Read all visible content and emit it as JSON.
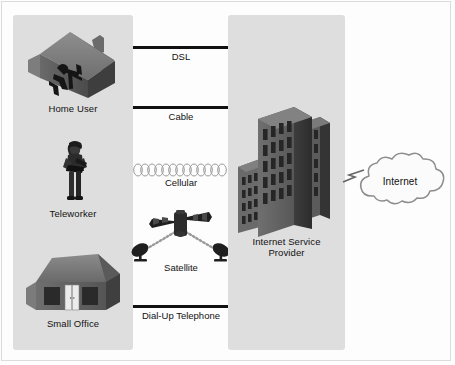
{
  "diagram": {
    "background_color": "#fdfdfd",
    "panel_color": "#dedede",
    "line_color": "#111111"
  },
  "left_panel": {
    "name": "customer-premises",
    "items": [
      {
        "id": "home-user",
        "label": "Home User",
        "icon": "house-with-user-icon"
      },
      {
        "id": "teleworker",
        "label": "Teleworker",
        "icon": "person-with-laptop-icon"
      },
      {
        "id": "small-office",
        "label": "Small Office",
        "icon": "small-office-building-icon"
      }
    ]
  },
  "connections": {
    "name": "access-technologies",
    "items": [
      {
        "id": "dsl",
        "label": "DSL",
        "style": "solid-line"
      },
      {
        "id": "cable",
        "label": "Cable",
        "style": "solid-line"
      },
      {
        "id": "cellular",
        "label": "Cellular",
        "style": "wave-loops"
      },
      {
        "id": "satellite",
        "label": "Satellite",
        "style": "satellite-dishes"
      },
      {
        "id": "dialup",
        "label": "Dial-Up Telephone",
        "style": "solid-line"
      }
    ]
  },
  "right_panel": {
    "name": "provider-network",
    "isp": {
      "label_line1": "Internet Service",
      "label_line2": "Provider",
      "icon": "office-towers-icon"
    }
  },
  "internet": {
    "label": "Internet",
    "icon": "cloud-icon",
    "link_icon": "lightning-bolt-icon"
  }
}
